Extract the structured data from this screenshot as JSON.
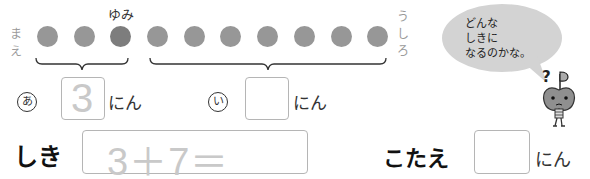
{
  "row_labels": {
    "front": [
      "ま",
      "え"
    ],
    "back": [
      "う",
      "し",
      "ろ"
    ],
    "yumi": "ゆみ"
  },
  "dots": {
    "count": 10,
    "highlighted_index": 2,
    "color": "#979797",
    "highlight_color": "#7d7d7d"
  },
  "groups": {
    "a": {
      "marker": "あ",
      "value": "3",
      "unit": "にん"
    },
    "i": {
      "marker": "い",
      "value": "",
      "unit": "にん"
    }
  },
  "speech_bubble": {
    "lines": [
      "どんな",
      "しきに",
      "なるのかな。"
    ]
  },
  "character": {
    "question_mark": "?",
    "flag": "P"
  },
  "expression": {
    "label": "しき",
    "value": "3＋7＝"
  },
  "answer": {
    "label": "こたえ",
    "value": "",
    "unit": "にん"
  }
}
